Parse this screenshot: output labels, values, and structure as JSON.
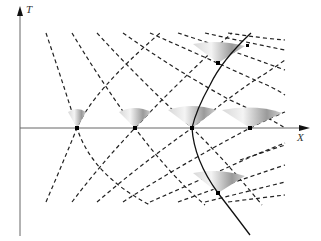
{
  "axes": {
    "t_label": "T",
    "x_label": "X"
  },
  "colors": {
    "axis": "#666666",
    "dash": "#222222",
    "worldline": "#111111",
    "cone_dark": "#8a8a8a",
    "cone_light": "#f2f2f2",
    "event": "#000000"
  },
  "diagram": {
    "events": [
      {
        "name": "event-1",
        "x": 77,
        "y": 128
      },
      {
        "name": "event-2",
        "x": 135,
        "y": 128
      },
      {
        "name": "event-3",
        "x": 192,
        "y": 128
      },
      {
        "name": "event-4",
        "x": 250,
        "y": 128
      },
      {
        "name": "event-upper",
        "x": 218,
        "y": 63
      },
      {
        "name": "event-lower",
        "x": 218,
        "y": 193
      }
    ]
  }
}
